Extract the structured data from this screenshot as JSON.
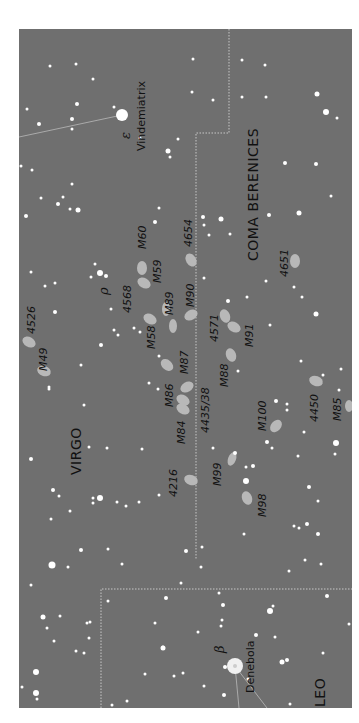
{
  "map": {
    "background": "#6f6f6f",
    "constellations": [
      {
        "name": "VIRGO",
        "x": 66,
        "y": 445
      },
      {
        "name": "COMA BERENICES",
        "x": 243,
        "y": 232
      },
      {
        "name": "LEO",
        "x": 310,
        "y": 678
      }
    ],
    "named_stars": [
      {
        "name": "Vindemiatrix",
        "greek": "ε",
        "x": 140,
        "y": 120
      },
      {
        "name": "Denebola",
        "greek": "β",
        "x": 249,
        "y": 662
      }
    ],
    "greek_labels": [
      {
        "symbol": "ρ",
        "x": 100,
        "y": 262
      },
      {
        "symbol": "ω",
        "x": 45,
        "y": 690
      }
    ],
    "objects": [
      {
        "label": "M60",
        "x": 138,
        "y": 215
      },
      {
        "label": "M59",
        "x": 153,
        "y": 250
      },
      {
        "label": "4654",
        "x": 183,
        "y": 215
      },
      {
        "label": "4651",
        "x": 282,
        "y": 246
      },
      {
        "label": "4568",
        "x": 123,
        "y": 281
      },
      {
        "label": "M89",
        "x": 165,
        "y": 284
      },
      {
        "label": "M90",
        "x": 186,
        "y": 275
      },
      {
        "label": "4526",
        "x": 28,
        "y": 302
      },
      {
        "label": "M58",
        "x": 146,
        "y": 318
      },
      {
        "label": "4571",
        "x": 212,
        "y": 310
      },
      {
        "label": "M91",
        "x": 245,
        "y": 316
      },
      {
        "label": "M49",
        "x": 38,
        "y": 340
      },
      {
        "label": "M87",
        "x": 180,
        "y": 343
      },
      {
        "label": "M88",
        "x": 220,
        "y": 357
      },
      {
        "label": "M86",
        "x": 165,
        "y": 375
      },
      {
        "label": "4435/38",
        "x": 201,
        "y": 400
      },
      {
        "label": "M84",
        "x": 177,
        "y": 413
      },
      {
        "label": "M100",
        "x": 258,
        "y": 400
      },
      {
        "label": "4450",
        "x": 310,
        "y": 390
      },
      {
        "label": "M85",
        "x": 333,
        "y": 390
      },
      {
        "label": "4216",
        "x": 169,
        "y": 466
      },
      {
        "label": "M99",
        "x": 212,
        "y": 455
      },
      {
        "label": "M98",
        "x": 258,
        "y": 486
      }
    ]
  }
}
